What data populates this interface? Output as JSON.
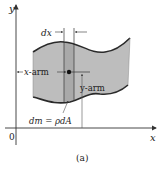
{
  "figure": {
    "caption": "(a)",
    "axes": {
      "x_label": "x",
      "y_label": "y",
      "origin_label": "0"
    },
    "labels": {
      "dx": "dx",
      "x_arm": "x-arm",
      "y_arm": "y-arm",
      "dm_eq": "dm = ρdA"
    },
    "colors": {
      "region_fill": "#bdbdbd",
      "strip_fill": "#a9a9a9",
      "outline": "#2a2a2a",
      "axis": "#333333"
    }
  }
}
